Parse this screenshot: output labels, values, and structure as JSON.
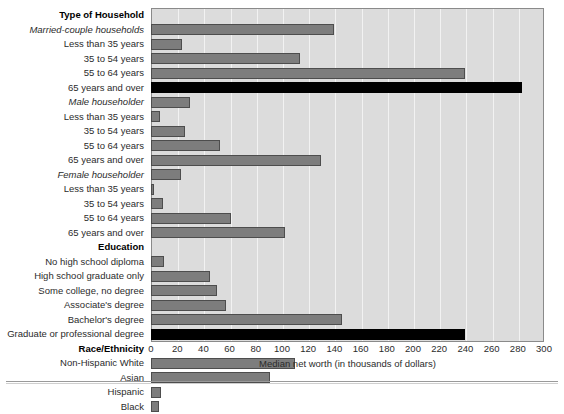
{
  "chart_data": {
    "type": "bar",
    "orientation": "horizontal",
    "title": "",
    "xlabel": "Median net worth (in thousands of dollars)",
    "ylabel": "",
    "xlim": [
      0,
      300
    ],
    "xticks": [
      0,
      20,
      40,
      60,
      80,
      100,
      120,
      140,
      160,
      180,
      200,
      220,
      240,
      260,
      280,
      300
    ],
    "grid": true,
    "legend": "none",
    "colors": {
      "bar": "#7d7d7d",
      "bar_border": "#4d4d4d",
      "highlight_bar": "#000000",
      "plot_background": "#dcdcdc",
      "gridline": "#f2f2f2"
    },
    "rows": [
      {
        "label": "Type of Household",
        "style": "header",
        "value": null,
        "highlight": false
      },
      {
        "label": "Married-couple households",
        "style": "subhead",
        "value": 140,
        "highlight": false
      },
      {
        "label": "Less than 35 years",
        "style": "normal",
        "value": 24,
        "highlight": false
      },
      {
        "label": "35 to 54 years",
        "style": "normal",
        "value": 114,
        "highlight": false
      },
      {
        "label": "55 to 64 years",
        "style": "normal",
        "value": 240,
        "highlight": false
      },
      {
        "label": "65 years and over",
        "style": "normal",
        "value": 283,
        "highlight": true
      },
      {
        "label": "Male householder",
        "style": "subhead",
        "value": 30,
        "highlight": false
      },
      {
        "label": "Less than 35 years",
        "style": "normal",
        "value": 7,
        "highlight": false
      },
      {
        "label": "35 to 54 years",
        "style": "normal",
        "value": 26,
        "highlight": false
      },
      {
        "label": "55 to 64 years",
        "style": "normal",
        "value": 53,
        "highlight": false
      },
      {
        "label": "65 years and over",
        "style": "normal",
        "value": 130,
        "highlight": false
      },
      {
        "label": "Female householder",
        "style": "subhead",
        "value": 23,
        "highlight": false
      },
      {
        "label": "Less than 35 years",
        "style": "normal",
        "value": 2,
        "highlight": false
      },
      {
        "label": "35 to 54 years",
        "style": "normal",
        "value": 9,
        "highlight": false
      },
      {
        "label": "55 to 64 years",
        "style": "normal",
        "value": 61,
        "highlight": false
      },
      {
        "label": "65 years and over",
        "style": "normal",
        "value": 102,
        "highlight": false
      },
      {
        "label": "Education",
        "style": "header",
        "value": null,
        "highlight": false
      },
      {
        "label": "No high school diploma",
        "style": "normal",
        "value": 10,
        "highlight": false
      },
      {
        "label": "High school graduate only",
        "style": "normal",
        "value": 45,
        "highlight": false
      },
      {
        "label": "Some college, no degree",
        "style": "normal",
        "value": 50,
        "highlight": false
      },
      {
        "label": "Associate's degree",
        "style": "normal",
        "value": 57,
        "highlight": false
      },
      {
        "label": "Bachelor's degree",
        "style": "normal",
        "value": 146,
        "highlight": false
      },
      {
        "label": "Graduate or professional degree",
        "style": "normal",
        "value": 240,
        "highlight": true
      },
      {
        "label": "Race/Ethnicity",
        "style": "header",
        "value": null,
        "highlight": false
      },
      {
        "label": "Non-Hispanic White",
        "style": "normal",
        "value": 110,
        "highlight": false
      },
      {
        "label": "Asian",
        "style": "normal",
        "value": 91,
        "highlight": false
      },
      {
        "label": "Hispanic",
        "style": "normal",
        "value": 8,
        "highlight": false
      },
      {
        "label": "Black",
        "style": "normal",
        "value": 6,
        "highlight": false
      }
    ]
  }
}
